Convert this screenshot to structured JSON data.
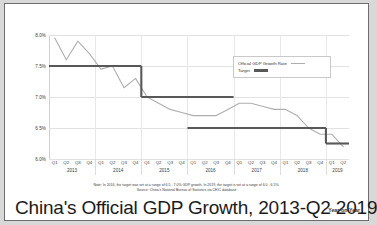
{
  "title": "China's Official GDP Growth, 2013-Q2 2019",
  "subtitle": "Year-on-Year",
  "legend": {
    "official_label": "Official GDP Growth Rate",
    "target_label": "Target"
  },
  "notes": {
    "note": "Note: In 2016, the target was set at a range of 6.5 - 7.0% GDP growth. In 2019, the target is set at a range of 6.0 - 6.5%.",
    "source": "Source: China's National Bureau of Statistics via CEIC database"
  },
  "colors": {
    "official_line": "#aeaeae",
    "target_line": "#585858",
    "grid": "#e2e2e2",
    "text": "#333333",
    "background": "#ffffff",
    "frame": "#6e6e6e"
  },
  "chart_data": {
    "type": "line",
    "title": "China's Official GDP Growth, 2013-Q2 2019",
    "xlabel": "",
    "ylabel": "",
    "ylim": [
      6.0,
      8.0
    ],
    "yticks": [
      6.0,
      6.5,
      7.0,
      7.5,
      8.0
    ],
    "ytick_labels": [
      "6.0%",
      "6.5%",
      "7.0%",
      "7.5%",
      "8.0%"
    ],
    "grid": true,
    "legend_position": "upper-right",
    "quarter_labels": [
      "Q1",
      "Q2",
      "Q3",
      "Q4"
    ],
    "years": [
      {
        "year": "2013",
        "quarters": [
          "Q1",
          "Q2",
          "Q3",
          "Q4"
        ]
      },
      {
        "year": "2014",
        "quarters": [
          "Q1",
          "Q2",
          "Q3",
          "Q4"
        ]
      },
      {
        "year": "2015",
        "quarters": [
          "Q1",
          "Q2",
          "Q3",
          "Q4"
        ]
      },
      {
        "year": "2016",
        "quarters": [
          "Q1",
          "Q2",
          "Q3",
          "Q4"
        ]
      },
      {
        "year": "2017",
        "quarters": [
          "Q1",
          "Q2",
          "Q3",
          "Q4"
        ]
      },
      {
        "year": "2018",
        "quarters": [
          "Q1",
          "Q2",
          "Q3",
          "Q4"
        ]
      },
      {
        "year": "2019",
        "quarters": [
          "Q1",
          "Q2"
        ]
      }
    ],
    "x": [
      "Q1 2013",
      "Q2 2013",
      "Q3 2013",
      "Q4 2013",
      "Q1 2014",
      "Q2 2014",
      "Q3 2014",
      "Q4 2014",
      "Q1 2015",
      "Q2 2015",
      "Q3 2015",
      "Q4 2015",
      "Q1 2016",
      "Q2 2016",
      "Q3 2016",
      "Q4 2016",
      "Q1 2017",
      "Q2 2017",
      "Q3 2017",
      "Q4 2017",
      "Q1 2018",
      "Q2 2018",
      "Q3 2018",
      "Q4 2018",
      "Q1 2019",
      "Q2 2019"
    ],
    "series": [
      {
        "name": "Official GDP Growth Rate",
        "color": "#aeaeae",
        "values": [
          7.95,
          7.6,
          7.9,
          7.7,
          7.45,
          7.5,
          7.15,
          7.3,
          7.0,
          6.9,
          6.8,
          6.75,
          6.7,
          6.7,
          6.7,
          6.8,
          6.9,
          6.9,
          6.85,
          6.8,
          6.8,
          6.7,
          6.5,
          6.4,
          6.4,
          6.2
        ]
      },
      {
        "name": "Target",
        "color": "#585858",
        "segments": [
          {
            "label": "2013-2014 target",
            "value": 7.5,
            "start": "Q1 2013",
            "end": "Q4 2014"
          },
          {
            "label": "2015-2016 target",
            "value": 7.0,
            "start": "Q1 2015",
            "end": "Q4 2016"
          },
          {
            "label": "2017-2018 target",
            "value": 6.5,
            "start": "Q1 2016",
            "end": "Q4 2018"
          },
          {
            "label": "2019 target midpoint",
            "value": 6.25,
            "start": "Q1 2019",
            "end": "Q2 2019"
          }
        ]
      }
    ]
  }
}
